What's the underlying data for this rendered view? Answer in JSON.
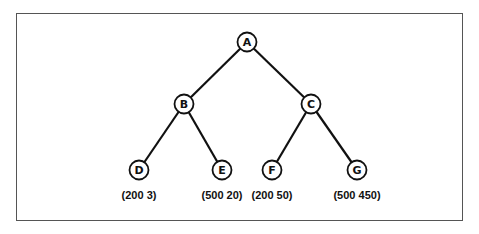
{
  "diagram": {
    "type": "binary-tree",
    "nodes": [
      {
        "id": "A",
        "label": "A",
        "x": 247,
        "y": 42
      },
      {
        "id": "B",
        "label": "B",
        "x": 184,
        "y": 104
      },
      {
        "id": "C",
        "label": "C",
        "x": 311,
        "y": 104
      },
      {
        "id": "D",
        "label": "D",
        "x": 139,
        "y": 170,
        "value": "(200 3)"
      },
      {
        "id": "E",
        "label": "E",
        "x": 222,
        "y": 170,
        "value": "(500 20)"
      },
      {
        "id": "F",
        "label": "F",
        "x": 272,
        "y": 170,
        "value": "(200 50)"
      },
      {
        "id": "G",
        "label": "G",
        "x": 357,
        "y": 170,
        "value": "(500 450)"
      }
    ],
    "edges": [
      [
        "A",
        "B"
      ],
      [
        "A",
        "C"
      ],
      [
        "B",
        "D"
      ],
      [
        "B",
        "E"
      ],
      [
        "C",
        "F"
      ],
      [
        "C",
        "G"
      ]
    ],
    "colors": {
      "line": "#111111",
      "node_fill": "#ffffff",
      "frame": "#555555"
    }
  }
}
